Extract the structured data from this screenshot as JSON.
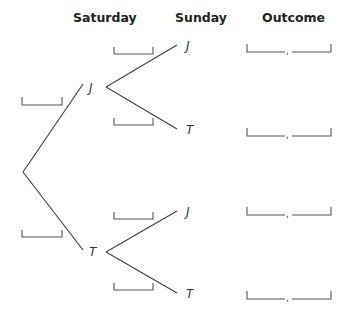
{
  "headers": {
    "saturday": "Saturday",
    "sunday": "Sunday",
    "outcome": "Outcome"
  },
  "tree": {
    "saturday_nodes": [
      {
        "label": "J",
        "probability_blank": ""
      },
      {
        "label": "T",
        "probability_blank": ""
      }
    ],
    "sunday_nodes": [
      {
        "parent": "J",
        "label": "J",
        "probability_blank": ""
      },
      {
        "parent": "J",
        "label": "T",
        "probability_blank": ""
      },
      {
        "parent": "T",
        "label": "J",
        "probability_blank": ""
      },
      {
        "parent": "T",
        "label": "T",
        "probability_blank": ""
      }
    ],
    "outcomes": [
      {
        "first": "",
        "separator": ",",
        "second": ""
      },
      {
        "first": "",
        "separator": ",",
        "second": ""
      },
      {
        "first": "",
        "separator": ",",
        "second": ""
      },
      {
        "first": "",
        "separator": ",",
        "second": ""
      }
    ]
  },
  "colors": {
    "lines": "#444444",
    "text": "#222222"
  }
}
